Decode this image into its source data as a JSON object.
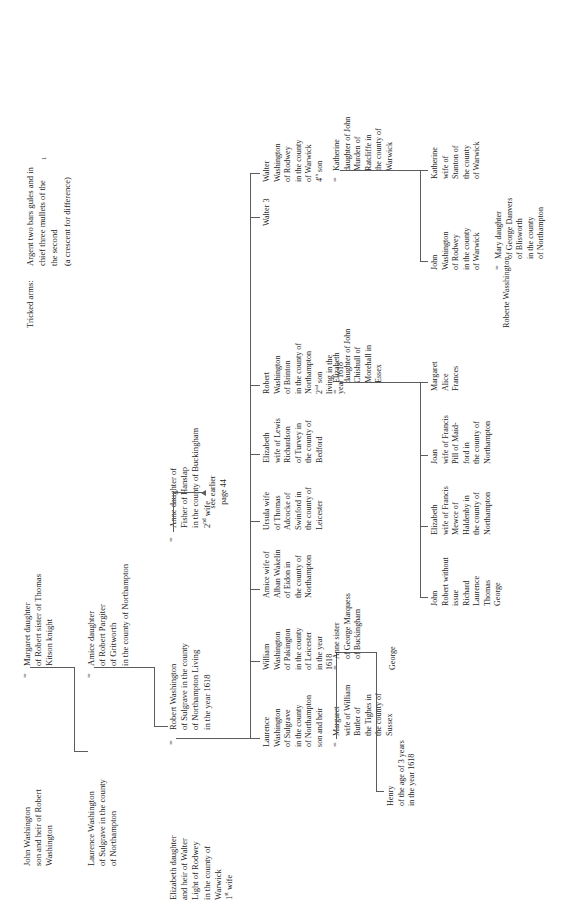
{
  "page": {
    "footer_note": "Roberte Wasshington",
    "tricked_arms": {
      "label": "Tricked arms:",
      "text": "Argent two bars gules and in\nchief three mullets of the\nthe second\n(a crescent for difference)"
    },
    "see_earlier": "see earlier\npage 44"
  },
  "pedigree": {
    "gen1": {
      "name": "John Washington\nson and heir of Robert\nWashington",
      "spouse": "Margaret daughter\nof Robert sister of Thomas\nKitson knight"
    },
    "gen2": {
      "name": "Laurence Washington\nof Sulgrave in the county\nof Northampton",
      "spouse": "Amice daughter\nof Robert Pargiter\nof Gritworth\nin the county of Northampton"
    },
    "gen3": {
      "name": "Robert Washington\nof Sulgrave in the county\nof Northampton Living\nin the year 1618",
      "wife1": "Elizabeth daughter\nand heir of Walter\nLight of Rodwey\nin the county of\nWarwick\n1st wife",
      "wife2": "Anne daughter of\nFisher of Hanslap\nin the county of Buckingham\n2nd wife"
    },
    "children_row": [
      {
        "name": "Laurence\nWashington\nof Sulgrave\nin the county\nof Northampton\nson and heir",
        "spouse": "Margaret\nwife of William\nButler of\nthe Tighes in\nthe county of\nSussex"
      },
      {
        "name": "William\nWashington\nof Pakington\nin the county\nof Leicester\nin the year\n1618",
        "spouse": "Anne sister\nof George Marquess\nof Buckingham"
      },
      {
        "name": "Amice wife of\nAlban Wakelin\nof Eidon in\nthe county of\nNorthampton",
        "spouse": ""
      },
      {
        "name": "Ursula wife\nof Thomas\nAdcocke of\nSwinford in\nthe county of\nLeicester",
        "spouse": ""
      },
      {
        "name": "Elizabeth\nwife of Lewis\nRichardson\nof Turvey in\nthe county of\nBedford",
        "spouse": ""
      },
      {
        "name": "Robert\nWashington\nof Brinton\nin the county of\nNorthampton\n2nd son\nliving in the\nyear 1618",
        "spouse": "Elizabeth\ndaughter of John\nChishull of\nMorehall in\nEssex"
      },
      {
        "name": "Walter 3",
        "spouse": ""
      },
      {
        "name": "Walter\nWashington\nof Rodwey\nin the county\nof Warwick\n4th son",
        "spouse": "Katherine\ndaughter of John\nMurden of\nRatcliffe in\nthe county of\nWarwick"
      }
    ],
    "grandchildren_left": [
      {
        "name": "Henry\nof the age of 3 years\nin the year 1618"
      },
      {
        "name": "George"
      }
    ],
    "robert_issue": [
      {
        "name": "John\nRobert without\nissue\nRichard\nLaurence\nThomas\nGeorge"
      },
      {
        "name": "Elizabeth\nwife of Francis\nMewce of\nHaldenby in\nthe county of\nNorthampton"
      },
      {
        "name": "Joan\nwife of Francis\nPill of Maid-\nford in\nthe county of\nNorthampton"
      },
      {
        "name": "Margaret\nAlice\nFrances"
      }
    ],
    "walter_issue": [
      {
        "name": "John\nWashington\nof Rodwey\nin the county\nof Warwick",
        "spouse": "Mary daughter\nof George Danvers\nof Blisworth\nin the county\nof Northampton"
      },
      {
        "name": "Katherine\nwife of\nStanton of\nthe county\nof Warwick",
        "spouse": ""
      }
    ]
  }
}
